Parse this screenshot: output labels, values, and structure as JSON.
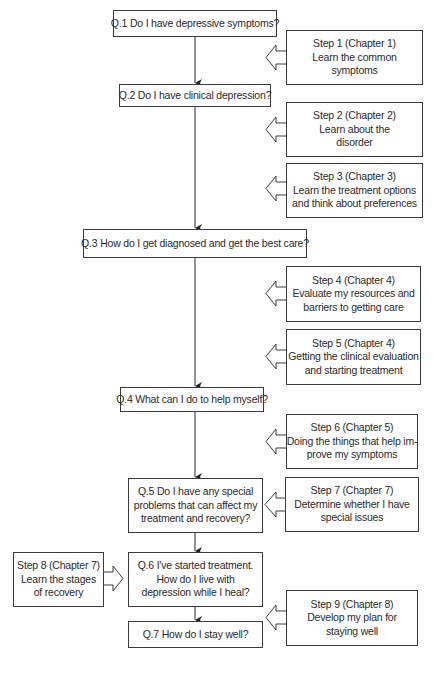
{
  "diagram": {
    "type": "flowchart",
    "colors": {
      "line": "#3a3a3a",
      "text": "#2a2a2a",
      "background": "#ffffff"
    },
    "questions": [
      {
        "id": "q1",
        "lines": [
          "Q.1 Do I have depressive symptoms?"
        ]
      },
      {
        "id": "q2",
        "lines": [
          "Q.2 Do I have clinical depression?"
        ]
      },
      {
        "id": "q3",
        "lines": [
          "Q.3 How do I get diagnosed and get the best care?"
        ]
      },
      {
        "id": "q4",
        "lines": [
          "Q.4 What can I do to help myself?"
        ]
      },
      {
        "id": "q5",
        "lines": [
          "Q.5 Do I have any special",
          "problems that can affect my",
          "treatment and recovery?"
        ]
      },
      {
        "id": "q6",
        "lines": [
          "Q.6 I've started treatment.",
          "How do I live with",
          "depression while I heal?"
        ]
      },
      {
        "id": "q7",
        "lines": [
          "Q.7 How do I stay well?"
        ]
      }
    ],
    "steps": [
      {
        "id": "s1",
        "lines": [
          "Step 1 (Chapter 1)",
          "Learn the common",
          "symptoms"
        ]
      },
      {
        "id": "s2",
        "lines": [
          "Step 2 (Chapter 2)",
          "Learn about the",
          "disorder"
        ]
      },
      {
        "id": "s3",
        "lines": [
          "Step 3 (Chapter 3)",
          "Learn the treatment options",
          "and think about preferences"
        ]
      },
      {
        "id": "s4",
        "lines": [
          "Step 4 (Chapter 4)",
          "Evaluate my resources and",
          "barriers to getting care"
        ]
      },
      {
        "id": "s5",
        "lines": [
          "Step 5 (Chapter 4)",
          "Getting the clinical evaluation",
          "and starting treatment"
        ]
      },
      {
        "id": "s6",
        "lines": [
          "Step 6 (Chapter 5)",
          "Doing the things that help im-",
          "prove my symptoms"
        ]
      },
      {
        "id": "s7",
        "lines": [
          "Step 7 (Chapter 7)",
          "Determine whether I have",
          "special issues"
        ]
      },
      {
        "id": "s8",
        "lines": [
          "Step 8 (Chapter 7)",
          "Learn the stages",
          "of recovery"
        ]
      },
      {
        "id": "s9",
        "lines": [
          "Step 9 (Chapter 8)",
          "Develop my plan for",
          "staying well"
        ]
      }
    ]
  }
}
